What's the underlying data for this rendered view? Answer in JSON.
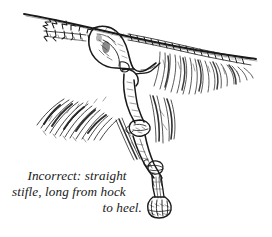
{
  "image": {
    "kind": "pen-and-ink anatomical illustration",
    "subject": "dog hindquarter skeleton with coat feathering",
    "width_px": 272,
    "height_px": 237,
    "background_color": "#ffffff",
    "ink_color": "#1a1a1a"
  },
  "caption": {
    "full_text": "Incorrect: straight stifle, long from hock to heel.",
    "lines": [
      "Incorrect: straight",
      "stifle, long from hock",
      "to heel."
    ],
    "style": "italic serif"
  },
  "anatomy": {
    "labels_visible": false,
    "parts": [
      "topline",
      "croup",
      "pelvis",
      "sacral-vertebrae",
      "tail-vertebrae",
      "femur",
      "stifle-joint",
      "tibia",
      "hock-joint",
      "metatarsus",
      "foot",
      "heel"
    ]
  },
  "coat": {
    "regions": [
      "flank-feathering",
      "tail-feathering",
      "rear-leg-feathering"
    ]
  }
}
